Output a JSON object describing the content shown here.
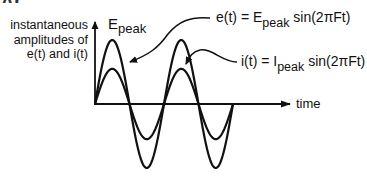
{
  "diagram": {
    "header_fragment": "AC Waveforms",
    "y_axis_label": [
      "instantaneous",
      "amplitudes of",
      "e(t) and i(t)"
    ],
    "x_axis_label": "time",
    "peak_label": {
      "main": "E",
      "sub": "peak"
    },
    "voltage_equation": {
      "lhs": "e(t) = E",
      "sub": "peak",
      "rhs": " sin(2πFt)"
    },
    "current_equation": {
      "lhs": "i(t) = I",
      "sub": "peak",
      "rhs": " sin(2πFt)"
    },
    "colors": {
      "stroke": "#111111",
      "background": "#ffffff"
    }
  },
  "chart_data": {
    "type": "line",
    "title": "",
    "xlabel": "time",
    "ylabel": "instantaneous amplitudes of e(t) and i(t)",
    "grid": false,
    "legend": "annotations",
    "x_cycles": 2,
    "series": [
      {
        "name": "e(t) = E_peak sin(2πFt)",
        "amplitude": 1.0,
        "phase": 0
      },
      {
        "name": "i(t) = I_peak sin(2πFt)",
        "amplitude": 0.55,
        "phase": 0
      }
    ],
    "annotations": [
      "E_peak marks the maximum of e(t)"
    ]
  }
}
